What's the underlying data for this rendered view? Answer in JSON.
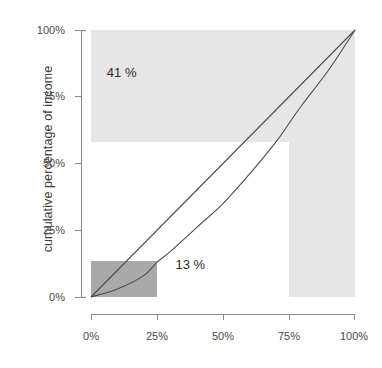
{
  "figure": {
    "title_faint": "",
    "background_color": "#ffffff"
  },
  "chart_data": {
    "type": "line",
    "title": "",
    "subtitle": "",
    "xlabel": "",
    "ylabel": "cumulative percentage of income",
    "xlim": [
      0,
      100
    ],
    "ylim": [
      0,
      100
    ],
    "grid": false,
    "legend": null,
    "x_tick_labels": [
      "0%",
      "25%",
      "50%",
      "75%",
      "100%"
    ],
    "x_tick_values": [
      0,
      25,
      50,
      75,
      100
    ],
    "y_tick_labels": [
      "0%",
      "25%",
      "50%",
      "75%",
      "100%"
    ],
    "y_tick_values": [
      0,
      25,
      50,
      75,
      100
    ],
    "series": [
      {
        "name": "line of equality",
        "style": "straight",
        "color": "#4d4d4d",
        "x": [
          0,
          100
        ],
        "values": [
          0,
          100
        ]
      },
      {
        "name": "Lorenz curve",
        "style": "convex",
        "color": "#4d4d4d",
        "x": [
          0,
          10,
          20,
          25,
          30,
          40,
          50,
          60,
          70,
          75,
          80,
          90,
          100
        ],
        "values": [
          0,
          3,
          8,
          13,
          17,
          26,
          35,
          46,
          58,
          65,
          72,
          85,
          100
        ]
      }
    ],
    "shaded_regions": [
      {
        "name": "top-income-band",
        "color": "#e6e6e6",
        "x_range": [
          0,
          100
        ],
        "y_range": [
          58,
          100
        ],
        "label": "41 %"
      },
      {
        "name": "top-population-band",
        "color": "#e6e6e6",
        "x_range": [
          75,
          100
        ],
        "y_range": [
          0,
          58
        ],
        "label": ""
      },
      {
        "name": "bottom-quartile-box",
        "color": "#a9a9a9",
        "x_range": [
          0,
          25
        ],
        "y_range": [
          0,
          13.5
        ],
        "label": "13 %"
      }
    ],
    "annotations": [
      {
        "name": "label-41-percent",
        "text": "41 %",
        "x": 6,
        "y": 84
      },
      {
        "name": "label-13-percent",
        "text": "13 %",
        "x": 32,
        "y": 12
      }
    ]
  }
}
